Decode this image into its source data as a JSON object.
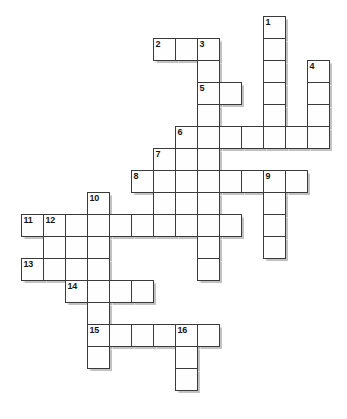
{
  "puzzle": {
    "title": "Crossword Puzzle Grid",
    "type": "crossword-grid",
    "grid": {
      "origin_x": 21,
      "origin_y": 16,
      "cell_size": 22,
      "columns": 15,
      "rows": 19,
      "cell_fill": "#fefefe",
      "cell_border": "#3a3a3a",
      "background": "#ffffff"
    },
    "cells": [
      {
        "c": 11,
        "r": 0,
        "n": "1"
      },
      {
        "c": 11,
        "r": 1,
        "n": ""
      },
      {
        "c": 11,
        "r": 2,
        "n": ""
      },
      {
        "c": 11,
        "r": 3,
        "n": ""
      },
      {
        "c": 11,
        "r": 4,
        "n": ""
      },
      {
        "c": 6,
        "r": 1,
        "n": "2"
      },
      {
        "c": 7,
        "r": 1,
        "n": ""
      },
      {
        "c": 8,
        "r": 1,
        "n": "3"
      },
      {
        "c": 8,
        "r": 2,
        "n": ""
      },
      {
        "c": 13,
        "r": 2,
        "n": "4"
      },
      {
        "c": 13,
        "r": 3,
        "n": ""
      },
      {
        "c": 13,
        "r": 4,
        "n": ""
      },
      {
        "c": 8,
        "r": 3,
        "n": "5"
      },
      {
        "c": 9,
        "r": 3,
        "n": ""
      },
      {
        "c": 8,
        "r": 4,
        "n": ""
      },
      {
        "c": 7,
        "r": 5,
        "n": "6"
      },
      {
        "c": 8,
        "r": 5,
        "n": ""
      },
      {
        "c": 9,
        "r": 5,
        "n": ""
      },
      {
        "c": 10,
        "r": 5,
        "n": ""
      },
      {
        "c": 11,
        "r": 5,
        "n": ""
      },
      {
        "c": 12,
        "r": 5,
        "n": ""
      },
      {
        "c": 13,
        "r": 5,
        "n": ""
      },
      {
        "c": 6,
        "r": 6,
        "n": "7"
      },
      {
        "c": 7,
        "r": 6,
        "n": ""
      },
      {
        "c": 8,
        "r": 6,
        "n": ""
      },
      {
        "c": 5,
        "r": 7,
        "n": "8"
      },
      {
        "c": 6,
        "r": 7,
        "n": ""
      },
      {
        "c": 7,
        "r": 7,
        "n": ""
      },
      {
        "c": 8,
        "r": 7,
        "n": ""
      },
      {
        "c": 9,
        "r": 7,
        "n": ""
      },
      {
        "c": 10,
        "r": 7,
        "n": ""
      },
      {
        "c": 11,
        "r": 7,
        "n": "9"
      },
      {
        "c": 12,
        "r": 7,
        "n": ""
      },
      {
        "c": 6,
        "r": 8,
        "n": ""
      },
      {
        "c": 7,
        "r": 8,
        "n": ""
      },
      {
        "c": 8,
        "r": 8,
        "n": ""
      },
      {
        "c": 11,
        "r": 8,
        "n": ""
      },
      {
        "c": 3,
        "r": 8,
        "n": "10"
      },
      {
        "c": 0,
        "r": 9,
        "n": "11"
      },
      {
        "c": 1,
        "r": 9,
        "n": "12"
      },
      {
        "c": 2,
        "r": 9,
        "n": ""
      },
      {
        "c": 3,
        "r": 9,
        "n": ""
      },
      {
        "c": 4,
        "r": 9,
        "n": ""
      },
      {
        "c": 5,
        "r": 9,
        "n": ""
      },
      {
        "c": 6,
        "r": 9,
        "n": ""
      },
      {
        "c": 7,
        "r": 9,
        "n": ""
      },
      {
        "c": 8,
        "r": 9,
        "n": ""
      },
      {
        "c": 9,
        "r": 9,
        "n": ""
      },
      {
        "c": 11,
        "r": 9,
        "n": ""
      },
      {
        "c": 1,
        "r": 10,
        "n": ""
      },
      {
        "c": 2,
        "r": 10,
        "n": ""
      },
      {
        "c": 3,
        "r": 10,
        "n": ""
      },
      {
        "c": 8,
        "r": 10,
        "n": ""
      },
      {
        "c": 11,
        "r": 10,
        "n": ""
      },
      {
        "c": 0,
        "r": 11,
        "n": "13"
      },
      {
        "c": 1,
        "r": 11,
        "n": ""
      },
      {
        "c": 2,
        "r": 11,
        "n": ""
      },
      {
        "c": 3,
        "r": 11,
        "n": ""
      },
      {
        "c": 8,
        "r": 11,
        "n": ""
      },
      {
        "c": 2,
        "r": 12,
        "n": "14"
      },
      {
        "c": 3,
        "r": 12,
        "n": ""
      },
      {
        "c": 4,
        "r": 12,
        "n": ""
      },
      {
        "c": 5,
        "r": 12,
        "n": ""
      },
      {
        "c": 3,
        "r": 13,
        "n": ""
      },
      {
        "c": 3,
        "r": 14,
        "n": "15"
      },
      {
        "c": 4,
        "r": 14,
        "n": ""
      },
      {
        "c": 5,
        "r": 14,
        "n": ""
      },
      {
        "c": 6,
        "r": 14,
        "n": ""
      },
      {
        "c": 7,
        "r": 14,
        "n": "16"
      },
      {
        "c": 8,
        "r": 14,
        "n": ""
      },
      {
        "c": 3,
        "r": 15,
        "n": ""
      },
      {
        "c": 7,
        "r": 15,
        "n": ""
      },
      {
        "c": 7,
        "r": 16,
        "n": ""
      }
    ],
    "clue_numbers": [
      "1",
      "2",
      "3",
      "4",
      "5",
      "6",
      "7",
      "8",
      "9",
      "10",
      "11",
      "12",
      "13",
      "14",
      "15",
      "16"
    ]
  }
}
